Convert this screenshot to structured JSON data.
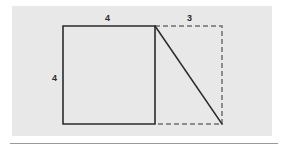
{
  "figure": {
    "kind": "geometry-diagram",
    "panel_color": "#e8e8e8",
    "page_color": "#ffffff",
    "stroke_color": "#2b2b2b",
    "dashed_stroke_color": "#6e6e6e",
    "divider_color": "#9a9a9a",
    "labels": {
      "top_left": "4",
      "top_right": "3",
      "left_side": "4"
    },
    "shapes": {
      "square": {
        "type": "solid-rectangle",
        "x1": 63,
        "y1": 26,
        "x2": 155,
        "y2": 124,
        "side_label_top": "4",
        "side_label_left": "4"
      },
      "extension": {
        "type": "dashed-rectangle",
        "x1": 155,
        "y1": 26,
        "x2": 222,
        "y2": 124,
        "side_label_top": "3"
      },
      "diagonal": {
        "type": "solid-line",
        "x1": 155,
        "y1": 26,
        "x2": 222,
        "y2": 124
      },
      "divider_line": {
        "type": "solid-line",
        "x1": 10,
        "y1": 143,
        "x2": 278,
        "y2": 143
      }
    }
  }
}
